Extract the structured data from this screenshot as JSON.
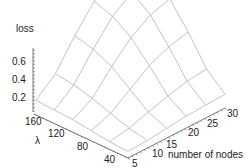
{
  "chart_data": {
    "type": "surface3d",
    "title": "",
    "zlabel": "loss",
    "xlabel": "number of nodes",
    "ylabel": "λ",
    "x_ticks": [
      5,
      10,
      15,
      20,
      25,
      30
    ],
    "y_ticks": [
      40,
      80,
      120,
      160
    ],
    "z_ticks": [
      0.2,
      0.4,
      0.6
    ],
    "x": [
      5,
      10,
      15,
      20,
      25,
      30
    ],
    "y": [
      20,
      50,
      80,
      110,
      140,
      170
    ],
    "z": [
      [
        0.02,
        0.03,
        0.05,
        0.07,
        0.08,
        0.09
      ],
      [
        0.03,
        0.06,
        0.11,
        0.16,
        0.2,
        0.22
      ],
      [
        0.05,
        0.11,
        0.22,
        0.33,
        0.4,
        0.44
      ],
      [
        0.07,
        0.16,
        0.33,
        0.48,
        0.58,
        0.63
      ],
      [
        0.08,
        0.2,
        0.4,
        0.58,
        0.69,
        0.75
      ],
      [
        0.09,
        0.22,
        0.44,
        0.63,
        0.75,
        0.8
      ]
    ],
    "zlim": [
      0,
      0.8
    ],
    "grid": false,
    "legend": null
  },
  "labels": {
    "zlabel": "loss",
    "xlabel": "number of nodes",
    "ylabel": "λ",
    "z_ticks": [
      "0.6",
      "0.4",
      "0.2"
    ],
    "y_ticks": [
      "160",
      "120",
      "80",
      "40"
    ],
    "x_ticks": [
      "5",
      "10",
      "15",
      "20",
      "25",
      "30"
    ]
  },
  "colors": {
    "mesh": "#b4b4b4",
    "axis": "#555555",
    "text": "#222222"
  }
}
